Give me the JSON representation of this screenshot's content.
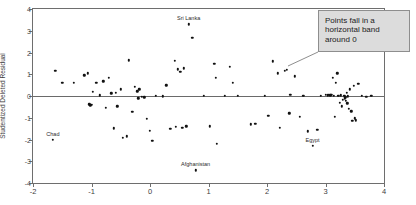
{
  "chart_data": {
    "type": "scatter",
    "title": "",
    "xlabel": "",
    "ylabel": "Studentized Deleted Residual",
    "xlim": [
      -2,
      4
    ],
    "ylim": [
      -4,
      4
    ],
    "xticks": [
      -2,
      -1,
      0,
      1,
      2,
      3,
      4
    ],
    "xticklabels": [
      "-2",
      "-1",
      "0",
      "1",
      "2",
      "3",
      "4"
    ],
    "yticks": [
      -4,
      -3,
      -2,
      -1,
      0,
      1,
      2,
      3,
      4
    ],
    "yticklabels": [
      "-4",
      "-3",
      "-2",
      "-1",
      "0",
      "1",
      "2",
      "3",
      "4"
    ],
    "grid": false,
    "reference_line": {
      "y": 0,
      "orientation": "horizontal"
    },
    "legend": null,
    "points": [
      [
        -1.66,
        -2.02
      ],
      [
        -1.62,
        1.15
      ],
      [
        -1.5,
        0.6
      ],
      [
        -1.3,
        0.6
      ],
      [
        -1.12,
        0.95
      ],
      [
        -1.06,
        1.05
      ],
      [
        -1.04,
        -0.38
      ],
      [
        -1.02,
        -0.42
      ],
      [
        -1.0,
        -0.4
      ],
      [
        -0.98,
        0.18
      ],
      [
        -0.92,
        0.62
      ],
      [
        -0.86,
        0.03
      ],
      [
        -0.8,
        0.68
      ],
      [
        -0.76,
        -0.55
      ],
      [
        -0.7,
        0.85
      ],
      [
        -0.66,
        0.12
      ],
      [
        -0.62,
        -1.49
      ],
      [
        -0.58,
        0.15
      ],
      [
        -0.56,
        -0.47
      ],
      [
        -0.5,
        0.3
      ],
      [
        -0.46,
        -1.92
      ],
      [
        -0.4,
        -1.86
      ],
      [
        -0.36,
        1.65
      ],
      [
        -0.3,
        -0.72
      ],
      [
        -0.26,
        0.42
      ],
      [
        -0.22,
        0.22
      ],
      [
        -0.2,
        -0.1
      ],
      [
        -0.18,
        0.3
      ],
      [
        -0.14,
        -0.04
      ],
      [
        -0.1,
        -0.06
      ],
      [
        -0.05,
        -1.05
      ],
      [
        0.0,
        -1.6
      ],
      [
        0.04,
        -2.05
      ],
      [
        0.1,
        0.0
      ],
      [
        0.22,
        -0.02
      ],
      [
        0.28,
        0.5
      ],
      [
        0.35,
        -1.5
      ],
      [
        0.42,
        1.62
      ],
      [
        0.44,
        -1.42
      ],
      [
        0.48,
        1.22
      ],
      [
        0.52,
        1.1
      ],
      [
        0.55,
        -1.45
      ],
      [
        0.58,
        1.28
      ],
      [
        0.62,
        -1.4
      ],
      [
        0.66,
        3.3
      ],
      [
        0.72,
        2.68
      ],
      [
        0.78,
        -3.42
      ],
      [
        0.92,
        0.0
      ],
      [
        1.02,
        -1.4
      ],
      [
        1.1,
        1.48
      ],
      [
        1.12,
        0.85
      ],
      [
        1.14,
        -2.2
      ],
      [
        1.28,
        0.0
      ],
      [
        1.36,
        1.35
      ],
      [
        1.42,
        0.6
      ],
      [
        1.5,
        0.02
      ],
      [
        1.72,
        -1.3
      ],
      [
        1.8,
        -1.28
      ],
      [
        1.96,
        0.0
      ],
      [
        2.02,
        -0.9
      ],
      [
        2.1,
        1.6
      ],
      [
        2.18,
        1.05
      ],
      [
        2.22,
        -1.45
      ],
      [
        2.3,
        1.15
      ],
      [
        2.34,
        1.2
      ],
      [
        2.38,
        -0.8
      ],
      [
        2.4,
        0.06
      ],
      [
        2.48,
        0.9
      ],
      [
        2.56,
        -0.95
      ],
      [
        2.62,
        0.02
      ],
      [
        2.7,
        -1.62
      ],
      [
        2.78,
        -2.3
      ],
      [
        2.86,
        -1.55
      ],
      [
        2.92,
        0.02
      ],
      [
        3.0,
        0.05
      ],
      [
        3.04,
        0.04
      ],
      [
        3.06,
        0.06
      ],
      [
        3.08,
        0.03
      ],
      [
        3.1,
        0.05
      ],
      [
        3.12,
        0.85
      ],
      [
        3.14,
        0.02
      ],
      [
        3.16,
        -0.95
      ],
      [
        3.18,
        0.62
      ],
      [
        3.2,
        1.05
      ],
      [
        3.22,
        0.0
      ],
      [
        3.24,
        -0.3
      ],
      [
        3.26,
        0.04
      ],
      [
        3.28,
        -0.48
      ],
      [
        3.3,
        -0.18
      ],
      [
        3.32,
        0.0
      ],
      [
        3.33,
        -0.1
      ],
      [
        3.34,
        -0.06
      ],
      [
        3.35,
        -0.22
      ],
      [
        3.36,
        0.14
      ],
      [
        3.37,
        -0.34
      ],
      [
        3.38,
        -0.02
      ],
      [
        3.4,
        -0.58
      ],
      [
        3.42,
        0.3
      ],
      [
        3.44,
        -0.7
      ],
      [
        3.46,
        -1.15
      ],
      [
        3.48,
        0.48
      ],
      [
        3.5,
        -1.02
      ],
      [
        3.52,
        -1.12
      ],
      [
        3.56,
        0.55
      ],
      [
        3.62,
        0.0
      ],
      [
        3.7,
        -0.05
      ],
      [
        3.78,
        0.02
      ]
    ],
    "annotated_points": [
      {
        "label": "Sri Lanka",
        "x": 0.66,
        "y": 3.3
      },
      {
        "label": "Chad",
        "x": -1.66,
        "y": -2.02
      },
      {
        "label": "Afghanistan",
        "x": 0.78,
        "y": -3.42
      },
      {
        "label": "Egypt",
        "x": 2.78,
        "y": -2.3
      }
    ],
    "annotations": [
      {
        "text": "Points fall in a horizontal band around 0"
      }
    ],
    "colors": {
      "point": "#111111",
      "axis": "#6e6e6e",
      "callout_bg": "#dcdcdc",
      "callout_border": "#8e8e8e",
      "text": "#2b2b2b"
    }
  },
  "callout": {
    "text": "Points fall in a horizontal band around 0"
  },
  "axis": {
    "y_title": "Studentized Deleted Residual",
    "x_title": ""
  }
}
